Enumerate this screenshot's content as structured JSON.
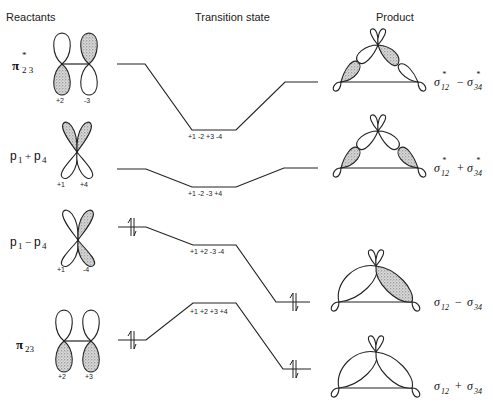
{
  "headers": {
    "reactants": "Reactants",
    "transition_state": "Transition state",
    "product": "Product"
  },
  "reactant_orbitals": [
    {
      "id": "pi23_star",
      "symbol": "π",
      "sup": "*",
      "sub": "2 3",
      "signs": [
        "+2",
        "-3"
      ]
    },
    {
      "id": "p1_plus_p4",
      "label": "p",
      "sub1": "1",
      "op": "+",
      "label2": "p",
      "sub2": "4",
      "signs": [
        "+1",
        "+4"
      ]
    },
    {
      "id": "p1_minus_p4",
      "label": "p",
      "sub1": "1",
      "op": "−",
      "label2": "p",
      "sub2": "4",
      "signs": [
        "+1",
        "-4"
      ]
    },
    {
      "id": "pi23",
      "symbol": "π",
      "sub": "23",
      "signs": [
        "+2",
        "+3"
      ]
    }
  ],
  "transition_state_labels": [
    "+1  -2  +3  -4",
    "+1  -2  -3  +4",
    "+1  +2  -3  -4",
    "+1  +2  +3  +4"
  ],
  "product_orbitals": [
    {
      "id": "sig12s_minus_sig34s",
      "a": "σ",
      "a_sub": "12",
      "a_sup": "*",
      "op": "−",
      "b": "σ",
      "b_sub": "34",
      "b_sup": "*"
    },
    {
      "id": "sig12s_plus_sig34s",
      "a": "σ",
      "a_sub": "12",
      "a_sup": "*",
      "op": "+",
      "b": "σ",
      "b_sub": "34",
      "b_sup": "*"
    },
    {
      "id": "sig12_minus_sig34",
      "a": "σ",
      "a_sub": "12",
      "a_sup": "",
      "op": "−",
      "b": "σ",
      "b_sub": "34",
      "b_sup": ""
    },
    {
      "id": "sig12_plus_sig34",
      "a": "σ",
      "a_sub": "12",
      "a_sup": "",
      "op": "+",
      "b": "σ",
      "b_sub": "34",
      "b_sup": ""
    }
  ],
  "electron_pairs": [
    "↿⇂",
    "↿⇂",
    "↿⇂",
    "↿⇂"
  ],
  "colors": {
    "line": "#222222",
    "stipple": "#9a9a9a",
    "background": "#ffffff"
  }
}
